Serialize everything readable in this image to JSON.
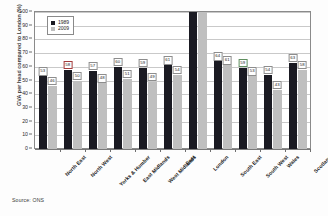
{
  "chart_data": {
    "type": "bar",
    "title": "",
    "xlabel": "",
    "ylabel": "GVA per head  compared to London (%)",
    "ylim": [
      0,
      100
    ],
    "ytick_step": 10,
    "yticks": [
      0,
      10,
      20,
      30,
      40,
      50,
      60,
      70,
      80,
      90,
      100
    ],
    "grid": true,
    "legend_position": "top-left inside plot",
    "categories": [
      "North East",
      "North West",
      "Yorks & Humber",
      "East Midlands",
      "West Midlands",
      "East",
      "London",
      "South East",
      "South West",
      "Wales",
      "Scotland"
    ],
    "series": [
      {
        "name": "1989",
        "color": "#1a1a22",
        "values": [
          53,
          58,
          57,
          60,
          59,
          61,
          100,
          64,
          59,
          54,
          63
        ],
        "labels": [
          "53",
          "58",
          "57",
          "60",
          "59",
          "61",
          "",
          "64",
          "59",
          "54",
          "63"
        ]
      },
      {
        "name": "2009",
        "color": "#bfbfbf",
        "values": [
          46,
          50,
          48,
          51,
          49,
          54,
          100,
          61,
          53,
          43,
          58
        ],
        "labels": [
          "46",
          "50",
          "48",
          "51",
          "49",
          "54",
          "",
          "61",
          "53",
          "43",
          "58"
        ]
      }
    ],
    "annotations": {
      "highlighted_labels": [
        {
          "series": "1989",
          "category": "North West",
          "value": "58",
          "outline": "red"
        },
        {
          "series": "1989",
          "category": "South West",
          "value": "59",
          "outline": "green"
        }
      ]
    }
  },
  "legend": {
    "items": [
      {
        "label": "1989",
        "swatch": "legend-swatch-1989"
      },
      {
        "label": "2009",
        "swatch": "legend-swatch-2009"
      }
    ]
  },
  "source": {
    "note": "Source: ONS"
  },
  "colors": {
    "series_1989": "#1a1a22",
    "series_2009": "#bfbfbf",
    "grid": "#c9c9c9",
    "frame": "#8a8a8a",
    "label_outline_red": "#a33b3b",
    "label_outline_green": "#5f8f5f"
  }
}
